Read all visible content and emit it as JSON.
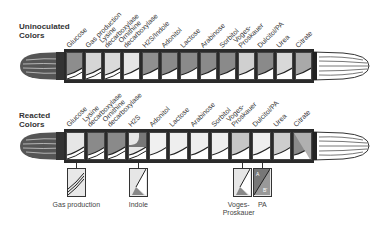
{
  "uninoculated": {
    "title": "Uninoculated\nColors",
    "labels": [
      "Glucose",
      "Gas production",
      "Lysine\ndecarboxylase",
      "Ornithine\ndecarboxylase",
      "H2S/Indole",
      "Adonitol",
      "Lactose",
      "Arabinose",
      "Sorbitol",
      "Voges-\nProskauer",
      "Dulcitol/PA",
      "Urea",
      "Citrate"
    ],
    "cells": [
      {
        "top": "#8d8d8d",
        "bottom": "#ffffff",
        "double": true
      },
      {
        "top": "#d6d6d6",
        "bottom": "#ffffff",
        "double": true
      },
      {
        "top": "#dadada",
        "bottom": "#ffffff",
        "double": true
      },
      {
        "top": "#e6e6e6",
        "bottom": "#ffffff",
        "double": false
      },
      {
        "top": "#8f8f8f",
        "bottom": "#ffffff",
        "double": false
      },
      {
        "top": "#8a8a8a",
        "bottom": "#ffffff",
        "double": false
      },
      {
        "top": "#8a8a8a",
        "bottom": "#ffffff",
        "double": false
      },
      {
        "top": "#8a8a8a",
        "bottom": "#ffffff",
        "double": false
      },
      {
        "top": "#8a8a8a",
        "bottom": "#ffffff",
        "double": false
      },
      {
        "top": "#d0d0d0",
        "bottom": "#ffffff",
        "double": false
      },
      {
        "top": "#8a8a8a",
        "bottom": "#ffffff",
        "double": false
      },
      {
        "top": "#d8d8d8",
        "bottom": "#ffffff",
        "double": false
      },
      {
        "top": "#a9a9a9",
        "bottom": "#ffffff",
        "double": false
      }
    ]
  },
  "reacted": {
    "title": "Reacted\nColors",
    "labels": [
      "Glucose",
      "Lysine\ndecarboxylase",
      "Ornithine\ndecarboxylase",
      "H2S",
      "Adonitol",
      "Lactose",
      "Arabinose",
      "Sorbitol",
      "Voges-\nProskauer",
      "Dulcitol/PA",
      "Urea",
      "Citrate"
    ],
    "cells": [
      {
        "top": "#e6e6e6",
        "bottom": "#ffffff",
        "double": true
      },
      {
        "top": "#8a8a8a",
        "bottom": "#ffffff",
        "double": true
      },
      {
        "top": "#8a8a8a",
        "bottom": "#ffffff",
        "double": true
      },
      {
        "top": "#e6e6e6",
        "bottom": "#ffffff",
        "double": true,
        "h2s": true
      },
      {
        "top": "#f0f0f0",
        "bottom": "#ffffff",
        "double": false
      },
      {
        "top": "#eeeeee",
        "bottom": "#ffffff",
        "double": false
      },
      {
        "top": "#eeeeee",
        "bottom": "#ffffff",
        "double": false
      },
      {
        "top": "#eeeeee",
        "bottom": "#ffffff",
        "double": false
      },
      {
        "top": "#c6c6c6",
        "bottom": "#ffffff",
        "double": false
      },
      {
        "top": "#eeeeee",
        "bottom": "#ffffff",
        "double": false
      },
      {
        "top": "#cdcdcd",
        "bottom": "#ffffff",
        "double": false
      },
      {
        "top": "#8a8a8a",
        "bottom": "#ffffff",
        "double": false,
        "citrate": true
      }
    ],
    "citrate_marks": {
      "a": "A",
      "b": "B"
    }
  },
  "details": [
    {
      "label": "Gas production",
      "cell_index": 0
    },
    {
      "label": "Indole",
      "cell_index": 3
    },
    {
      "label": "Voges-\nProskauer",
      "cell_index": 8
    },
    {
      "label": "PA",
      "cell_index": 9,
      "marks": {
        "a": "A",
        "b": "B'"
      }
    }
  ]
}
